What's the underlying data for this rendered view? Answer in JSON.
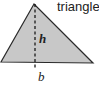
{
  "figure": {
    "title": "triangle",
    "height_label": "h",
    "base_label": "b",
    "colors": {
      "fill": "#c8c8c8",
      "stroke": "#2a2a2a",
      "text": "#222222"
    }
  }
}
